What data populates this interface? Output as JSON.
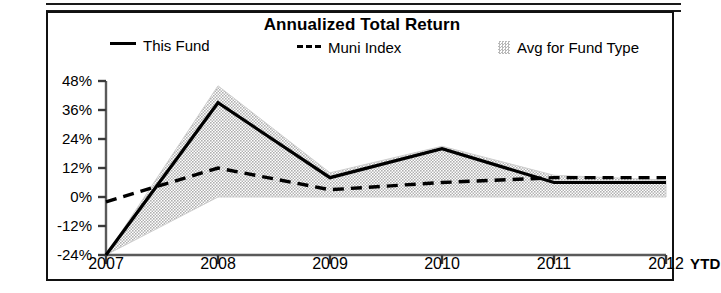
{
  "chart_data": {
    "type": "line",
    "title": "Annualized Total Return",
    "xlabel": "",
    "ylabel": "",
    "grid": false,
    "legend_position": "top",
    "x": [
      "2007",
      "2008",
      "2009",
      "2010",
      "2011",
      "2012"
    ],
    "x_axis_suffix_label": "YTD",
    "ylim": [
      -24,
      48
    ],
    "yticks": [
      48,
      36,
      24,
      12,
      0,
      -12,
      -24
    ],
    "ytick_labels": [
      "48%",
      "36%",
      "24%",
      "12%",
      "0%",
      "-12%",
      "-24%"
    ],
    "xtick_labels": [
      "2007",
      "2008",
      "2009",
      "2010",
      "2011",
      "2012"
    ],
    "series": [
      {
        "name": "This Fund",
        "style": "solid",
        "color": "#000000",
        "values": [
          -24,
          39,
          8,
          20,
          6,
          6
        ]
      },
      {
        "name": "Muni Index",
        "style": "dashed",
        "color": "#000000",
        "values": [
          -2,
          12,
          3,
          6,
          8,
          8
        ]
      },
      {
        "name": "Avg for Fund Type",
        "style": "band",
        "color": "#c9c9c9",
        "band_upper": [
          -24,
          46,
          10,
          21,
          9,
          7
        ],
        "band_lower": [
          -24,
          0,
          0,
          0,
          0,
          0
        ]
      }
    ]
  },
  "legend": {
    "items": [
      {
        "label": "This Fund",
        "marker": "solid-line-swatch"
      },
      {
        "label": "Muni Index",
        "marker": "dashed-line-swatch"
      },
      {
        "label": "Avg for Fund Type",
        "marker": "shaded-box-swatch"
      }
    ]
  },
  "colors": {
    "line": "#000000",
    "band_fill": "#c9c9c9",
    "axis": "#4a4a4a",
    "border": "#111111",
    "background": "#ffffff"
  }
}
